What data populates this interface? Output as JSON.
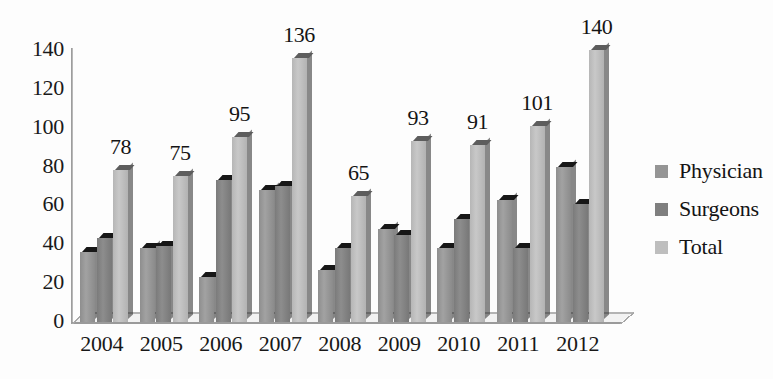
{
  "chart_data": {
    "type": "bar",
    "title": "",
    "subtitle": "",
    "xlabel": "",
    "ylabel": "",
    "categories": [
      "2004",
      "2005",
      "2006",
      "2007",
      "2008",
      "2009",
      "2010",
      "2011",
      "2012"
    ],
    "series": [
      {
        "name": "Physician",
        "color": "#959595",
        "values": [
          36,
          38,
          23,
          68,
          27,
          48,
          38,
          63,
          80
        ]
      },
      {
        "name": "Surgeons",
        "color": "#7f7f7f",
        "values": [
          43,
          39,
          73,
          70,
          38,
          45,
          53,
          38,
          61
        ]
      },
      {
        "name": "Total",
        "color": "#bebebe",
        "values": [
          78,
          75,
          95,
          136,
          65,
          93,
          91,
          101,
          140
        ]
      }
    ],
    "data_labels": {
      "series": "Total",
      "values": [
        "78",
        "75",
        "95",
        "136",
        "65",
        "93",
        "91",
        "101",
        "140"
      ]
    },
    "ylim": [
      0,
      140
    ],
    "ytick_labels": [
      "140",
      "120",
      "100",
      "80",
      "60",
      "40",
      "20",
      "0"
    ],
    "ytick_values": [
      140,
      120,
      100,
      80,
      60,
      40,
      20,
      0
    ],
    "ytick_step": 20,
    "grid": false,
    "legend_position": "right",
    "style": "3d-column"
  },
  "legend": {
    "items": [
      {
        "label": "Physician",
        "color": "#959595"
      },
      {
        "label": "Surgeons",
        "color": "#7f7f7f"
      },
      {
        "label": "Total",
        "color": "#bebebe"
      }
    ]
  }
}
